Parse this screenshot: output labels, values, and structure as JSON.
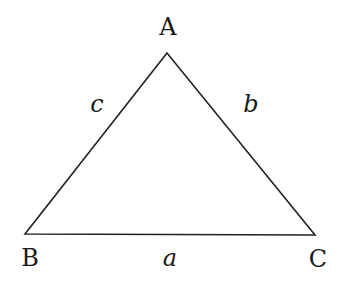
{
  "diagram": {
    "type": "triangle",
    "vertices": [
      {
        "label": "A",
        "x": 167,
        "y": 53,
        "label_x": 168,
        "label_y": 35
      },
      {
        "label": "B",
        "x": 25,
        "y": 234,
        "label_x": 30,
        "label_y": 266
      },
      {
        "label": "C",
        "x": 315,
        "y": 235,
        "label_x": 318,
        "label_y": 267
      }
    ],
    "sides": [
      {
        "label": "a",
        "between": "B-C",
        "label_x": 170,
        "label_y": 266
      },
      {
        "label": "b",
        "between": "A-C",
        "label_x": 251,
        "label_y": 112
      },
      {
        "label": "c",
        "between": "A-B",
        "label_x": 97,
        "label_y": 112
      }
    ],
    "stroke_color": "#222222",
    "background": "#ffffff"
  }
}
